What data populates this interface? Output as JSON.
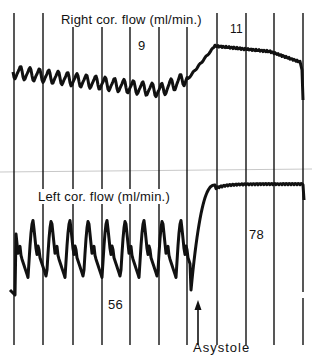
{
  "chart_data": {
    "type": "line",
    "title": "",
    "xlabel": "",
    "ylabel": "",
    "grid": {
      "vertical_lines_x_px": [
        14,
        43,
        73,
        102,
        130,
        159,
        187,
        217,
        246,
        274,
        303
      ],
      "horizontal": false
    },
    "panels": [
      {
        "name": "Right coronary flow",
        "label": "Right cor. flow (ml/min.)",
        "series": [
          {
            "name": "Right cor. flow",
            "phases": [
              {
                "phase": "before asystole",
                "pulsatile": true,
                "mean_flow": 9
              },
              {
                "phase": "after asystole",
                "pulsatile": false,
                "mean_flow": 11
              }
            ]
          }
        ],
        "annotations": [
          {
            "text": "9",
            "position": "before asystole"
          },
          {
            "text": "11",
            "position": "after asystole"
          }
        ]
      },
      {
        "name": "Left coronary flow",
        "label": "Left cor. flow (ml/min.)",
        "series": [
          {
            "name": "Left cor. flow",
            "phases": [
              {
                "phase": "before asystole",
                "pulsatile": true,
                "mean_flow": 56
              },
              {
                "phase": "after asystole",
                "pulsatile": false,
                "mean_flow": 78
              }
            ]
          }
        ],
        "annotations": [
          {
            "text": "56",
            "position": "before asystole"
          },
          {
            "text": "78",
            "position": "after asystole"
          }
        ]
      }
    ],
    "event_marker": {
      "text": "Asystole",
      "symbol": "up-arrow"
    }
  },
  "labels": {
    "right_title": "Right cor. flow (ml/min.)",
    "right_before": "9",
    "right_after": "11",
    "left_title": "Left cor. flow (ml/min.)",
    "left_before": "56",
    "left_after": "78",
    "event": "Asystole"
  },
  "colors": {
    "ink": "#111111",
    "paper": "#ffffff",
    "guide": "#c8c8c8"
  }
}
